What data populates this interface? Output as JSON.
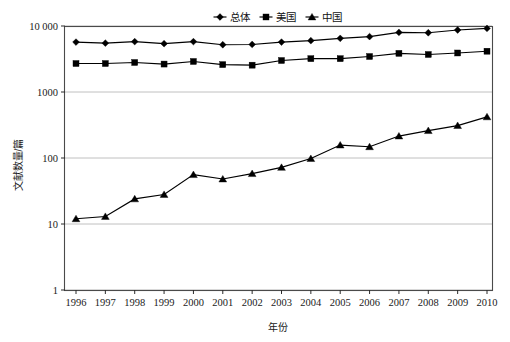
{
  "chart_data": {
    "type": "line",
    "title": "",
    "xlabel": "年份",
    "ylabel": "文献数量/篇",
    "yscale": "log",
    "ylim": [
      1,
      10000
    ],
    "grid": true,
    "legend_position": "top-center",
    "x": [
      1996,
      1997,
      1998,
      1999,
      2000,
      2001,
      2002,
      2003,
      2004,
      2005,
      2006,
      2007,
      2008,
      2009,
      2010
    ],
    "categories": [
      "1996",
      "1997",
      "1998",
      "1999",
      "2000",
      "2001",
      "2002",
      "2003",
      "2004",
      "2005",
      "2006",
      "2007",
      "2008",
      "2009",
      "2010"
    ],
    "ytick_labels": [
      "1",
      "10",
      "100",
      "1000",
      "10 000"
    ],
    "ytick_values": [
      1,
      10,
      100,
      1000,
      10000
    ],
    "series": [
      {
        "name": "总体",
        "marker": "diamond",
        "values": [
          5700,
          5500,
          5800,
          5400,
          5800,
          5200,
          5250,
          5700,
          6000,
          6500,
          6900,
          8000,
          7900,
          8700,
          9200
        ]
      },
      {
        "name": "美国",
        "marker": "square",
        "values": [
          2700,
          2700,
          2800,
          2650,
          2900,
          2600,
          2550,
          3000,
          3200,
          3200,
          3450,
          3850,
          3700,
          3900,
          4150
        ]
      },
      {
        "name": "中国",
        "marker": "triangle",
        "values": [
          12,
          13,
          24,
          28,
          56,
          48,
          58,
          72,
          98,
          157,
          148,
          215,
          260,
          310,
          420
        ]
      }
    ]
  },
  "legend": {
    "items": [
      {
        "label": "总体",
        "marker": "diamond"
      },
      {
        "label": "美国",
        "marker": "square"
      },
      {
        "label": "中国",
        "marker": "triangle"
      }
    ]
  },
  "axes": {
    "x_title": "年份",
    "y_title": "文献数量/篇"
  },
  "colors": {
    "series": "#000000",
    "grid": "#b9b9b9",
    "frame": "#4a4a4a",
    "background": "#ffffff"
  }
}
